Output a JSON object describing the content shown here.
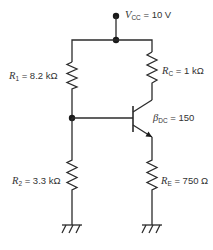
{
  "diagram": {
    "type": "voltage-divider-biased BJT amplifier (NPN)",
    "colors": {
      "wire": "#2b2b2b",
      "text": "#333333",
      "background": "#ffffff"
    },
    "supply": {
      "symbol": "V",
      "subscript": "CC",
      "value": "= 10 V"
    },
    "components": {
      "r1": {
        "symbol": "R",
        "subscript": "1",
        "value": "= 8.2 kΩ"
      },
      "rc": {
        "symbol": "R",
        "subscript": "C",
        "value": "= 1 kΩ"
      },
      "transistor": {
        "symbol": "β",
        "subscript": "DC",
        "value": "= 150"
      },
      "r2": {
        "symbol": "R",
        "subscript": "2",
        "value": "= 3.3 kΩ"
      },
      "re": {
        "symbol": "R",
        "subscript": "E",
        "value": "= 750 Ω"
      }
    },
    "grounds": [
      "ground-left",
      "ground-right"
    ]
  }
}
